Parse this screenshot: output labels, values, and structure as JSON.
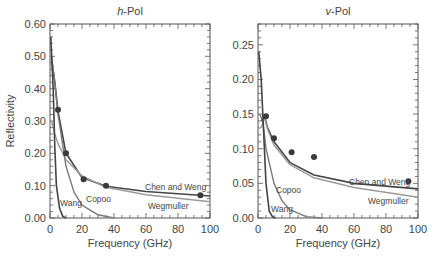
{
  "chart_data": [
    {
      "type": "line",
      "title": "h-Pol",
      "title_italic_part": "h",
      "title_rest": "-Pol",
      "xlabel": "Frequency (GHz)",
      "ylabel": "Reflectivity",
      "xlim": [
        0,
        100
      ],
      "ylim": [
        0,
        0.6
      ],
      "xticks": [
        "0",
        "20",
        "40",
        "60",
        "80",
        "100"
      ],
      "yticks": [
        "0.00",
        "0.10",
        "0.20",
        "0.30",
        "0.40",
        "0.50",
        "0.60"
      ],
      "grid": false,
      "series": [
        {
          "name": "Observed",
          "kind": "scatter",
          "x": [
            5,
            10,
            21,
            35,
            94
          ],
          "y": [
            0.335,
            0.2,
            0.12,
            0.1,
            0.07
          ]
        },
        {
          "name": "Chen and Weng",
          "kind": "line",
          "x": [
            1,
            3,
            5,
            10,
            20,
            35,
            60,
            100
          ],
          "y": [
            0.49,
            0.42,
            0.33,
            0.2,
            0.125,
            0.098,
            0.082,
            0.068
          ]
        },
        {
          "name": "Wegmuller",
          "kind": "line",
          "x": [
            1,
            3,
            5,
            10,
            20,
            35,
            60,
            100
          ],
          "y": [
            0.3,
            0.26,
            0.23,
            0.18,
            0.13,
            0.095,
            0.072,
            0.05
          ]
        },
        {
          "name": "Copoo",
          "kind": "line",
          "x": [
            1,
            3,
            5,
            10,
            15,
            20,
            30,
            40
          ],
          "y": [
            0.5,
            0.42,
            0.32,
            0.16,
            0.08,
            0.04,
            0.01,
            0.0
          ]
        },
        {
          "name": "Wang",
          "kind": "line",
          "x": [
            0.5,
            2,
            3,
            4,
            6,
            8,
            10
          ],
          "y": [
            0.56,
            0.4,
            0.22,
            0.1,
            0.03,
            0.005,
            0.0
          ]
        }
      ],
      "annotations": [
        "Chen and Weng",
        "Wegmuller",
        "Copoo",
        "Wang"
      ]
    },
    {
      "type": "line",
      "title": "v-Pol",
      "title_italic_part": "v",
      "title_rest": "-Pol",
      "xlabel": "Frequency (GHz)",
      "ylabel": "",
      "xlim": [
        0,
        100
      ],
      "ylim": [
        0,
        0.28
      ],
      "xticks": [
        "0",
        "20",
        "40",
        "60",
        "80",
        "100"
      ],
      "yticks": [
        "0.00",
        "0.05",
        "0.10",
        "0.15",
        "0.20",
        "0.25"
      ],
      "grid": false,
      "series": [
        {
          "name": "Observed",
          "kind": "scatter",
          "x": [
            5,
            10,
            21,
            35,
            94
          ],
          "y": [
            0.147,
            0.115,
            0.095,
            0.088,
            0.053
          ]
        },
        {
          "name": "Chen and Weng",
          "kind": "line",
          "x": [
            2,
            4,
            6,
            10,
            20,
            35,
            60,
            100
          ],
          "y": [
            0.14,
            0.148,
            0.13,
            0.11,
            0.08,
            0.062,
            0.05,
            0.042
          ]
        },
        {
          "name": "Wegmuller",
          "kind": "line",
          "x": [
            2,
            4,
            6,
            10,
            20,
            35,
            60,
            100
          ],
          "y": [
            0.13,
            0.145,
            0.128,
            0.105,
            0.077,
            0.058,
            0.044,
            0.03
          ]
        },
        {
          "name": "Copoo",
          "kind": "line",
          "x": [
            1,
            3,
            5,
            10,
            15,
            20,
            30,
            40
          ],
          "y": [
            0.15,
            0.14,
            0.1,
            0.05,
            0.025,
            0.012,
            0.002,
            0.0
          ]
        },
        {
          "name": "Wang",
          "kind": "line",
          "x": [
            0.5,
            2,
            3,
            5,
            7,
            9,
            11
          ],
          "y": [
            0.24,
            0.2,
            0.15,
            0.05,
            0.01,
            0.002,
            0.0
          ]
        }
      ],
      "annotations": [
        "Chen and Weng",
        "Wegmuller",
        "Copoo",
        "Wang"
      ]
    }
  ]
}
